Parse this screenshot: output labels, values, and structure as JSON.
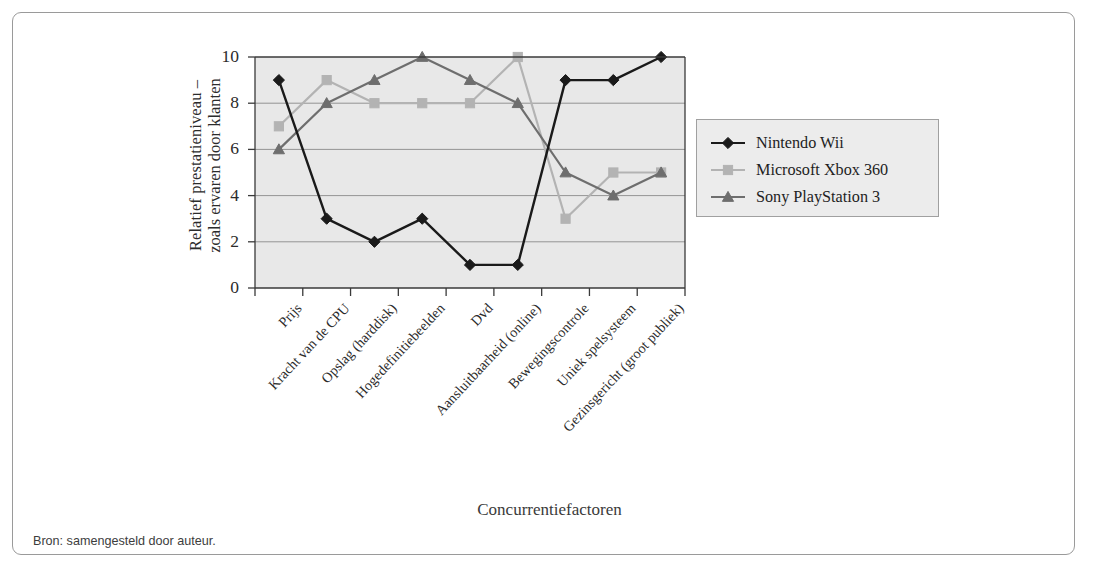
{
  "figure": {
    "source_note": "Bron: samengesteld door auteur.",
    "x_axis_title": "Concurrentiefactoren",
    "y_axis_title_line1": "Relatief prestatieniveau –",
    "y_axis_title_line2": "zoals ervaren door klanten"
  },
  "colors": {
    "plot_background": "#e8e8e8",
    "gridline": "#888888",
    "axis": "#3a3a3a",
    "frame": "#9a9a9a",
    "series_wii": "#1a1a1a",
    "series_xbox": "#b3b3b3",
    "series_ps3": "#6e6e6e",
    "legend_background": "#ececec"
  },
  "chart_data": {
    "type": "line",
    "title": "",
    "xlabel": "Concurrentiefactoren",
    "ylabel": "Relatief prestatieniveau – zoals ervaren door klanten",
    "ylim": [
      0,
      10
    ],
    "yticks": [
      0,
      2,
      4,
      6,
      8,
      10
    ],
    "grid": true,
    "legend_position": "right",
    "categories": [
      "Prijs",
      "Kracht van de CPU",
      "Opslag (harddisk)",
      "Hogedefinitiebeelden",
      "Dvd",
      "Aansluitbaarheid (online)",
      "Bewegingscontrole",
      "Uniek spelsysteem",
      "Gezinsgericht (groot publiek)"
    ],
    "series": [
      {
        "name": "Nintendo Wii",
        "marker": "diamond",
        "color": "#1a1a1a",
        "values": [
          9,
          3,
          2,
          3,
          1,
          1,
          9,
          9,
          10
        ]
      },
      {
        "name": "Microsoft Xbox 360",
        "marker": "square",
        "color": "#b3b3b3",
        "values": [
          7,
          9,
          8,
          8,
          8,
          10,
          3,
          5,
          5
        ]
      },
      {
        "name": "Sony PlayStation 3",
        "marker": "triangle",
        "color": "#6e6e6e",
        "values": [
          6,
          8,
          9,
          10,
          9,
          8,
          5,
          4,
          5
        ]
      }
    ]
  }
}
